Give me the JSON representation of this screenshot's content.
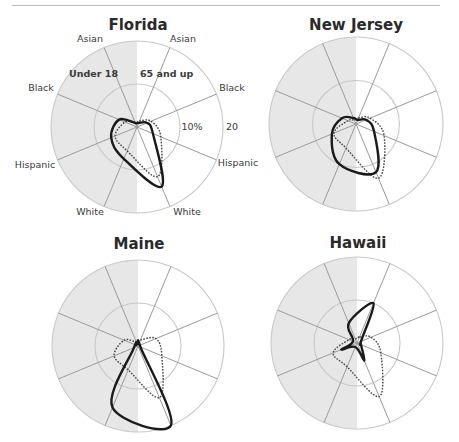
{
  "chart_data": {
    "type": "radar",
    "axis_unit": "%",
    "rings": [
      10,
      20
    ],
    "ring_labels": [
      "10%",
      "20"
    ],
    "halves": {
      "left": "Under 18",
      "right": "65 and up"
    },
    "spokes": [
      {
        "half": "65 and up",
        "category": "Asian",
        "angle": 22.5
      },
      {
        "half": "65 and up",
        "category": "Black",
        "angle": 67.5
      },
      {
        "half": "65 and up",
        "category": "Hispanic",
        "angle": 112.5
      },
      {
        "half": "65 and up",
        "category": "White",
        "angle": 157.5
      },
      {
        "half": "Under 18",
        "category": "White",
        "angle": 202.5
      },
      {
        "half": "Under 18",
        "category": "Hispanic",
        "angle": 247.5
      },
      {
        "half": "Under 18",
        "category": "Black",
        "angle": 292.5
      },
      {
        "half": "Under 18",
        "category": "Asian",
        "angle": 337.5
      }
    ],
    "legend": {
      "solid": "state",
      "dotted": "comparison"
    },
    "charts": [
      {
        "title": "Florida",
        "cx": 137,
        "cy": 127,
        "r": 86,
        "solid": [
          1,
          2.5,
          4,
          15,
          8,
          6.5,
          4.5,
          1
        ],
        "dotted": [
          1.5,
          3.5,
          6,
          12.5,
          6,
          5.5,
          3,
          1
        ],
        "show_labels": true
      },
      {
        "title": "New Jersey",
        "cx": 356,
        "cy": 124,
        "r": 87,
        "solid": [
          1,
          2.5,
          4.5,
          12,
          10,
          6,
          3.5,
          1.5
        ],
        "dotted": [
          1.5,
          3.5,
          7,
          13.5,
          6,
          5.5,
          2,
          1
        ],
        "show_labels": false
      },
      {
        "title": "Maine",
        "cx": 138,
        "cy": 346,
        "r": 86,
        "solid": [
          0.5,
          0.5,
          0.6,
          20,
          15.5,
          1,
          0.5,
          0.5
        ],
        "dotted": [
          1.5,
          4.5,
          6,
          13,
          6,
          6,
          3.5,
          1
        ],
        "show_labels": false
      },
      {
        "title": "Hawaii",
        "cx": 357,
        "cy": 343,
        "r": 86,
        "solid": [
          10,
          1,
          1,
          4.5,
          1,
          4,
          1,
          5
        ],
        "dotted": [
          1.5,
          3.5,
          6,
          13.5,
          6,
          6,
          2,
          1
        ],
        "show_labels": false
      }
    ],
    "labels": {
      "asian": "Asian",
      "black": "Black",
      "hispanic": "Hispanic",
      "white": "White",
      "under18": "Under 18",
      "over65": "65 and up",
      "ring10": "10%",
      "ring20": "20"
    },
    "colors": {
      "left_fill": "#e7e7e7",
      "right_fill": "#ffffff",
      "spoke": "#9a9a9a",
      "ring": "#c8c8c8",
      "solid": "#1a1a1a",
      "dotted": "#444444"
    }
  }
}
